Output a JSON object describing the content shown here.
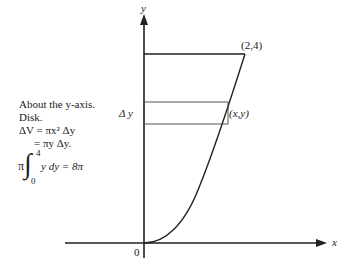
{
  "annotation": {
    "line1": "About the y-axis.",
    "line2": "Disk.",
    "line3": "ΔV = πx² Δy",
    "line4": "= πy Δy.",
    "integral": {
      "prefix": "π",
      "symbol": "∫",
      "upper": "4",
      "lower": "0",
      "integrand": "y dy = 8π"
    }
  },
  "labels": {
    "y_axis": "y",
    "x_axis": "x",
    "origin": "0",
    "point_top": "(2,4)",
    "point_xy": "(x,y)",
    "delta_y": "Δ y"
  },
  "colors": {
    "ink": "#222222",
    "background": "#ffffff"
  }
}
